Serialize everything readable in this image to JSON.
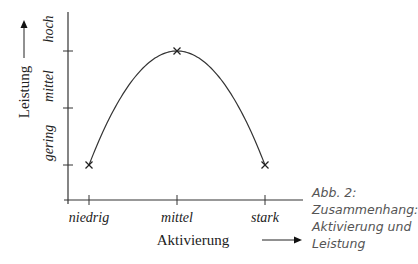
{
  "chart_data": {
    "type": "line",
    "title": "",
    "xlabel": "Aktivierung",
    "ylabel": "Leistung",
    "x_categories": [
      "niedrig",
      "mittel",
      "stark"
    ],
    "y_categories": [
      "gering",
      "mittel",
      "hoch"
    ],
    "points": [
      {
        "x": "niedrig",
        "y": "gering"
      },
      {
        "x": "mittel",
        "y": "hoch"
      },
      {
        "x": "stark",
        "y": "gering"
      }
    ],
    "curve": "inverted-u",
    "marker": "x",
    "grid": false,
    "legend": "none"
  },
  "caption": {
    "lines": [
      "Abb. 2:",
      "Zusammenhang:",
      "Aktivierung und",
      "Leistung"
    ]
  },
  "colors": {
    "line": "#333333",
    "caption": "#555555"
  }
}
